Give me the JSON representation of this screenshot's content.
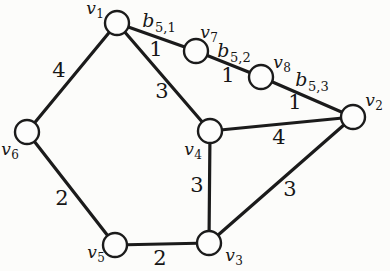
{
  "diagram": {
    "background": "#fcfcfa",
    "line_color": "#1b1b1b",
    "node_fill": "#fdfdfc",
    "node_stroke": "#1b1b1b",
    "node_radius": 12,
    "line_width": 3.2,
    "node_stroke_width": 2.4
  },
  "nodes": [
    {
      "id": "v1",
      "x": 117,
      "y": 23,
      "label": {
        "main": "v",
        "sub": "1",
        "x": 95,
        "y": 14
      }
    },
    {
      "id": "v2",
      "x": 353,
      "y": 117,
      "label": {
        "main": "v",
        "sub": "2",
        "x": 374,
        "y": 106
      }
    },
    {
      "id": "v3",
      "x": 209,
      "y": 243,
      "label": {
        "main": "v",
        "sub": "3",
        "x": 234,
        "y": 261
      }
    },
    {
      "id": "v4",
      "x": 210,
      "y": 131,
      "label": {
        "main": "v",
        "sub": "4",
        "x": 193,
        "y": 155
      }
    },
    {
      "id": "v5",
      "x": 115,
      "y": 245,
      "label": {
        "main": "v",
        "sub": "5",
        "x": 96,
        "y": 258
      }
    },
    {
      "id": "v6",
      "x": 27,
      "y": 132,
      "label": {
        "main": "v",
        "sub": "6",
        "x": 10,
        "y": 155
      }
    },
    {
      "id": "v7",
      "x": 196,
      "y": 51,
      "label": {
        "main": "v",
        "sub": "7",
        "x": 209,
        "y": 38
      }
    },
    {
      "id": "v8",
      "x": 261,
      "y": 77,
      "label": {
        "main": "v",
        "sub": "8",
        "x": 282,
        "y": 68
      }
    }
  ],
  "edges": [
    {
      "from": "v1",
      "to": "v7",
      "labels": [
        {
          "kind": "name",
          "main": "b",
          "sub": "5,1",
          "x": 159,
          "y": 27
        },
        {
          "kind": "weight",
          "main": "1",
          "sub": "",
          "x": 156,
          "y": 56
        }
      ]
    },
    {
      "from": "v7",
      "to": "v8",
      "labels": [
        {
          "kind": "name",
          "main": "b",
          "sub": "5,2",
          "x": 234,
          "y": 57
        },
        {
          "kind": "weight",
          "main": "1",
          "sub": "",
          "x": 228,
          "y": 82
        }
      ]
    },
    {
      "from": "v8",
      "to": "v2",
      "labels": [
        {
          "kind": "name",
          "main": "b",
          "sub": "5,3",
          "x": 312,
          "y": 86
        },
        {
          "kind": "weight",
          "main": "1",
          "sub": "",
          "x": 295,
          "y": 109
        }
      ]
    },
    {
      "from": "v1",
      "to": "v6",
      "labels": [
        {
          "kind": "weight",
          "main": "4",
          "sub": "",
          "x": 59,
          "y": 77
        }
      ]
    },
    {
      "from": "v1",
      "to": "v4",
      "labels": [
        {
          "kind": "weight",
          "main": "3",
          "sub": "",
          "x": 162,
          "y": 98
        }
      ]
    },
    {
      "from": "v4",
      "to": "v2",
      "labels": [
        {
          "kind": "weight",
          "main": "4",
          "sub": "",
          "x": 279,
          "y": 144
        }
      ]
    },
    {
      "from": "v4",
      "to": "v3",
      "labels": [
        {
          "kind": "weight",
          "main": "3",
          "sub": "",
          "x": 197,
          "y": 192
        }
      ]
    },
    {
      "from": "v3",
      "to": "v2",
      "labels": [
        {
          "kind": "weight",
          "main": "3",
          "sub": "",
          "x": 290,
          "y": 196
        }
      ]
    },
    {
      "from": "v6",
      "to": "v5",
      "labels": [
        {
          "kind": "weight",
          "main": "2",
          "sub": "",
          "x": 62,
          "y": 205
        }
      ]
    },
    {
      "from": "v5",
      "to": "v3",
      "labels": [
        {
          "kind": "weight",
          "main": "2",
          "sub": "",
          "x": 160,
          "y": 265
        }
      ]
    }
  ]
}
